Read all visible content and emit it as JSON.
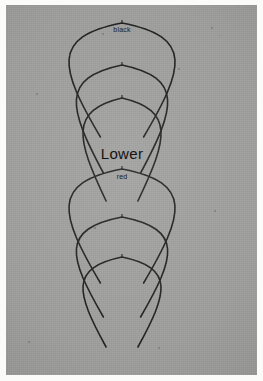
{
  "photo": {
    "background_color": "#9d9d9b",
    "border_color": "#fbfbfa",
    "wire_color": "#1a1a1a"
  },
  "labels": {
    "top_group": "black",
    "title": "Lower",
    "bottom_group": "red"
  },
  "chart_data": {
    "type": "line",
    "title": "Lower",
    "xlabel": "",
    "ylabel": "",
    "annotations": [
      "black",
      "Lower",
      "red"
    ],
    "series": [
      {
        "name": "black-arch-1",
        "apex_x": 116,
        "apex_y": 18,
        "half_width": 72,
        "leg_bottom_y": 132,
        "group": "black"
      },
      {
        "name": "black-arch-2",
        "apex_x": 116,
        "apex_y": 60,
        "half_width": 62,
        "leg_bottom_y": 168,
        "group": "black"
      },
      {
        "name": "black-arch-3",
        "apex_x": 116,
        "apex_y": 93,
        "half_width": 53,
        "leg_bottom_y": 196,
        "group": "black"
      },
      {
        "name": "red-arch-1",
        "apex_x": 116,
        "apex_y": 164,
        "half_width": 72,
        "leg_bottom_y": 278,
        "group": "red"
      },
      {
        "name": "red-arch-2",
        "apex_x": 116,
        "apex_y": 212,
        "half_width": 62,
        "leg_bottom_y": 312,
        "group": "red"
      },
      {
        "name": "red-arch-3",
        "apex_x": 116,
        "apex_y": 252,
        "half_width": 53,
        "leg_bottom_y": 342,
        "group": "red"
      }
    ]
  }
}
